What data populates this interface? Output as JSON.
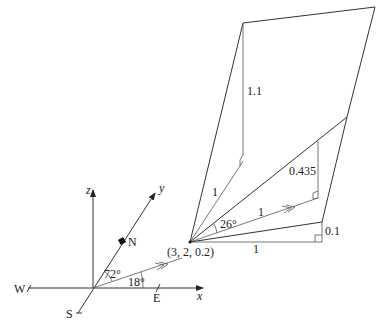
{
  "diagram": {
    "type": "3d-vector-geometry",
    "axes": {
      "x_label": "x",
      "y_label": "y",
      "z_label": "z",
      "compass": {
        "north": "N",
        "south": "S",
        "east": "E",
        "west": "W"
      },
      "angle_from_north": "72°",
      "angle_from_east": "18°"
    },
    "point": {
      "label": "(3, 2, 0.2)"
    },
    "plane": {
      "vertical_upper": "1.1",
      "slant_upper": "1",
      "vertical_mid": "0.435",
      "direction_unit": "1",
      "angle_elevation": "26°",
      "base": "1",
      "vertical_lower": "0.1"
    }
  }
}
